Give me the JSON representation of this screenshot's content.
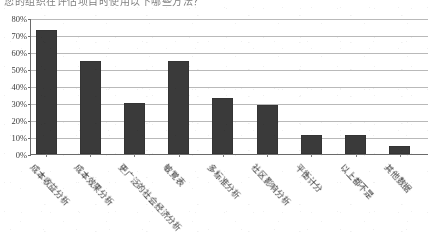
{
  "caption": {
    "text": "您的组织在评估项目时使用以下哪些方法？"
  },
  "chart_data": {
    "type": "bar",
    "title": "",
    "subtitle": "",
    "xlabel": "",
    "ylabel": "",
    "categories": [
      "成本收益分析",
      "成本效果分析",
      "更广泛的社会经济分析",
      "敏覚表",
      "多标准分析",
      "社区影响分析",
      "平衡计分",
      "以上都不是",
      "其他数据"
    ],
    "values": [
      73,
      55,
      30,
      55,
      33,
      29,
      11,
      11,
      5
    ],
    "value_labels": [
      "73%",
      "55%",
      "30%",
      "55%",
      "33%",
      "29%",
      "11%",
      "11%",
      "5%"
    ],
    "ylim": [
      0,
      80
    ],
    "yticks": [
      0,
      10,
      20,
      30,
      40,
      50,
      60,
      70,
      80
    ],
    "ytick_labels": [
      "0%",
      "10%",
      "20%",
      "30%",
      "40%",
      "50%",
      "60%",
      "70%",
      "80%"
    ],
    "grid": true,
    "legend": false,
    "legend_position": "none",
    "bar_color": "#3a3a3a",
    "grid_color": "#b9b9b9",
    "axis_color": "#6a6a6a"
  }
}
